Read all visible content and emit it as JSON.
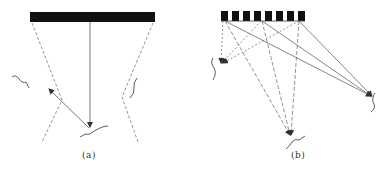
{
  "panels": [
    {
      "id": "a",
      "label": "(a)",
      "description": "Single wide transducer emitting a vertical beam; scattered reflection from surface"
    },
    {
      "id": "b",
      "label": "(b)",
      "description": "Array of 8 elements with beams steered to three targets (left, bottom, right)"
    }
  ],
  "colors": {
    "transducer": "#111111",
    "line": "#555555",
    "dashed": "#777777"
  },
  "array_element_count": 8
}
